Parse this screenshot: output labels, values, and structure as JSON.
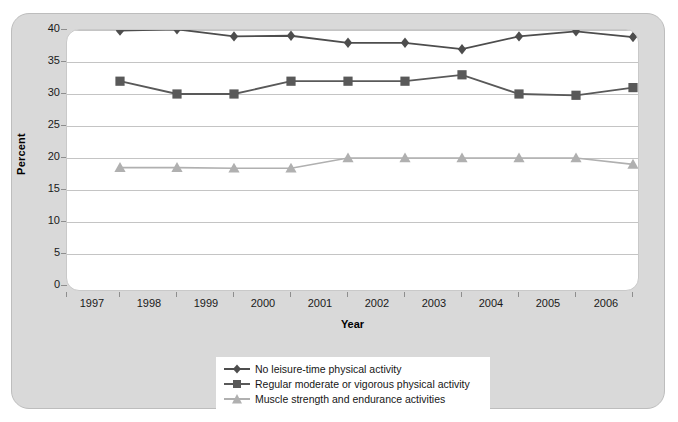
{
  "chart_data": {
    "type": "line",
    "title": "",
    "xlabel": "Year",
    "ylabel": "Percent",
    "categories": [
      "1997",
      "1998",
      "1999",
      "2000",
      "2001",
      "2002",
      "2003",
      "2004",
      "2005",
      "2006"
    ],
    "ylim": [
      0,
      40
    ],
    "yticks": [
      0,
      5,
      10,
      15,
      20,
      25,
      30,
      35,
      40
    ],
    "grid": true,
    "legend_position": "bottom-center",
    "series": [
      {
        "name": "No leisure-time physical activity",
        "marker": "diamond",
        "color": "#4d4d4d",
        "values": [
          39.9,
          40.1,
          39.0,
          39.1,
          38.0,
          38.0,
          37.0,
          39.0,
          39.8,
          38.9
        ]
      },
      {
        "name": "Regular moderate or vigorous physical activity",
        "marker": "square",
        "color": "#595959",
        "values": [
          32.0,
          30.0,
          30.0,
          32.0,
          32.0,
          32.0,
          33.0,
          30.0,
          29.8,
          31.0
        ]
      },
      {
        "name": "Muscle strength and endurance activities",
        "marker": "triangle",
        "color": "#b0b0b0",
        "values": [
          18.5,
          18.5,
          18.4,
          18.4,
          20.0,
          20.0,
          20.0,
          20.0,
          20.0,
          19.0
        ]
      }
    ]
  },
  "axes": {
    "y_title": "Percent",
    "x_title": "Year",
    "y_tick_labels": [
      "40",
      "35",
      "30",
      "25",
      "20",
      "15",
      "10",
      "5",
      "0"
    ],
    "x_tick_labels": [
      "1997",
      "1998",
      "1999",
      "2000",
      "2001",
      "2002",
      "2003",
      "2004",
      "2005",
      "2006"
    ]
  },
  "legend": {
    "items": [
      {
        "label": "No leisure-time physical activity",
        "marker": "diamond-marker",
        "color": "#4d4d4d"
      },
      {
        "label": "Regular moderate or vigorous physical activity",
        "marker": "square-marker",
        "color": "#595959"
      },
      {
        "label": "Muscle strength and endurance activities",
        "marker": "triangle-marker",
        "color": "#b0b0b0"
      }
    ]
  },
  "colors": {
    "panel_background": "#d9d9d9",
    "plot_background": "#ffffff",
    "gridline": "#c4c4c4",
    "series_dark": "#4d4d4d",
    "series_mid": "#595959",
    "series_light": "#b0b0b0"
  }
}
